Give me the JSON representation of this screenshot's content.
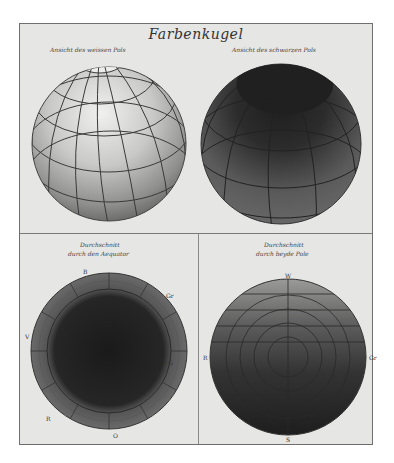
{
  "plate": {
    "title": "Farbenkugel",
    "panels": [
      {
        "id": "white-pole",
        "caption": "Ansicht des weissen Pols"
      },
      {
        "id": "black-pole",
        "caption": "Ansicht des schwarzen Pols"
      },
      {
        "id": "equator-section",
        "caption_line1": "Durchschnitt",
        "caption_line2": "durch den Aequator",
        "labels": {
          "top": "B",
          "top_right": "Gr",
          "right": "G",
          "bottom": "O",
          "bottom_left": "R",
          "left": "V"
        }
      },
      {
        "id": "poles-section",
        "caption_line1": "Durchschnitt",
        "caption_line2": "durch beyde Pole",
        "labels": {
          "top": "W",
          "right": "Gr",
          "bottom": "S",
          "left": "R"
        }
      }
    ]
  },
  "colors": {
    "paper": "#e6e6e4",
    "frame": "#6e6e6e",
    "sphere_light": "#d8d8d6",
    "sphere_dark": "#3a3a3a",
    "ink": "#333333"
  }
}
